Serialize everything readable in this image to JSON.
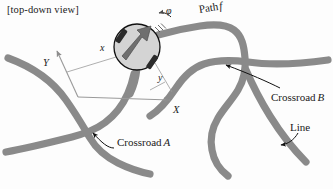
{
  "figure": {
    "title": "[top-down view]",
    "type": "top-down-robot-line-following-diagram",
    "background_color": "#fdfdfd"
  },
  "colors": {
    "road": "#8a8a8a",
    "road_edge": "#7c7c7c",
    "robot_fill": "#d4d4d4",
    "robot_outline": "#111111",
    "wheel": "#2b2b2b",
    "arrow": "#6f6f6f",
    "axis": "#9a9a9a",
    "leader": "#111111",
    "text": "#1a1a1a"
  },
  "labels": {
    "title": "[top-down view]",
    "heading_angle": "φ",
    "path": "Path",
    "path_symbol": "f",
    "axis_y": "Y",
    "axis_x": "X",
    "dim_x": "x",
    "dim_y": "y",
    "crossroad_a": "Crossroad",
    "crossroad_a_symbol": "A",
    "crossroad_b": "Crossroad",
    "crossroad_b_symbol": "B",
    "line": "Line"
  },
  "robot": {
    "center_x": 137,
    "center_y": 47,
    "radius": 23,
    "heading_deg": -52,
    "wheels": [
      {
        "cx": 123,
        "cy": 34,
        "angle_deg": -55
      },
      {
        "cx": 152,
        "cy": 61,
        "angle_deg": -55
      }
    ]
  },
  "axes": {
    "origin_x": 78,
    "origin_y": 97,
    "y_tip_x": 57,
    "y_tip_y": 50,
    "x_tip_x": 172,
    "x_tip_y": 100
  },
  "annotations": [
    {
      "name": "crossroad-a",
      "target_x": 88,
      "target_y": 130,
      "label_x": 117,
      "label_y": 137
    },
    {
      "name": "crossroad-b",
      "target_x": 220,
      "target_y": 62,
      "label_x": 271,
      "label_y": 92
    },
    {
      "name": "line",
      "target_x": 281,
      "target_y": 135,
      "label_x": 290,
      "label_y": 122
    }
  ]
}
